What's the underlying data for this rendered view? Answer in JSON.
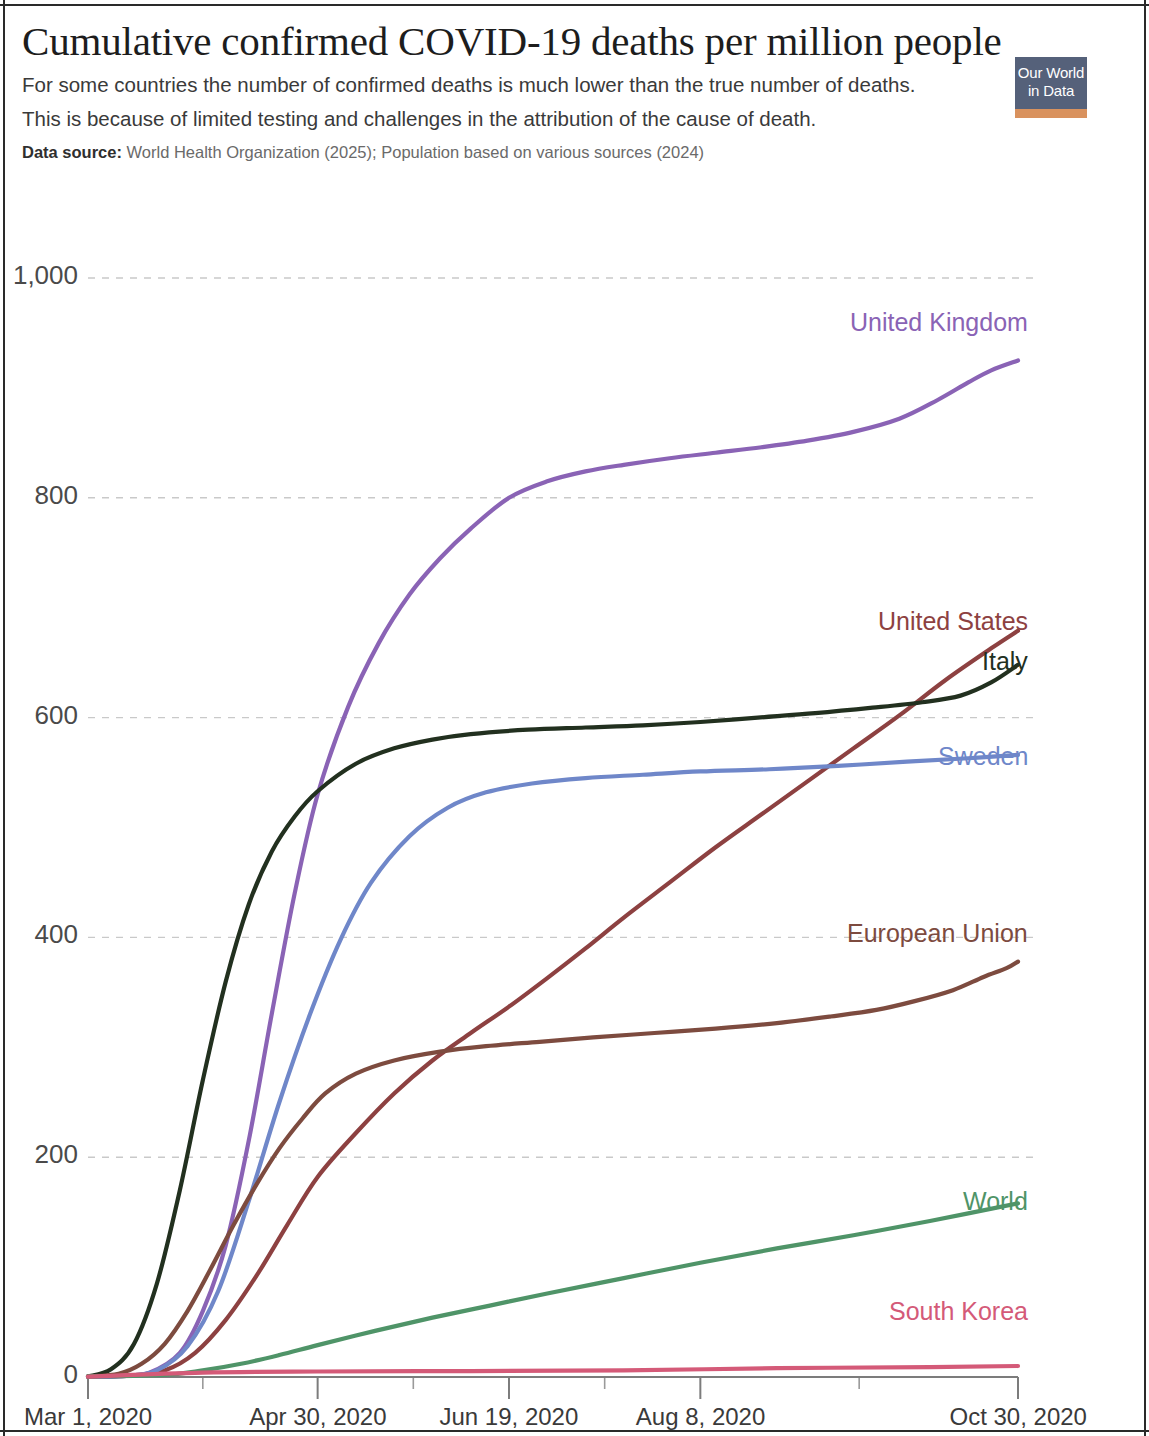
{
  "header": {
    "title": "Cumulative confirmed COVID-19 deaths per million people",
    "subtitle_line_1": "For some countries the number of confirmed deaths is much lower than the true number of deaths.",
    "subtitle_line_2": "This is because of limited testing and challenges in the attribution of the cause of death.",
    "source_label": "Data source:",
    "source_text": "World Health Organization (2025); Population based on various sources (2024)"
  },
  "logo": {
    "line1": "Our World",
    "line2": "in Data",
    "bg_color": "#55617a",
    "accent_color": "#d9925e"
  },
  "chart_data": {
    "type": "line",
    "title": "Cumulative confirmed COVID-19 deaths per million people",
    "xlabel": "",
    "ylabel": "",
    "grid": true,
    "legend_position": "right-inline-labels",
    "ylim": [
      0,
      1000
    ],
    "yticks": [
      0,
      200,
      400,
      600,
      800,
      1000
    ],
    "ytick_labels": [
      "0",
      "200",
      "400",
      "600",
      "800",
      "1,000"
    ],
    "xtick_labels": [
      "Mar 1, 2020",
      "Apr 30, 2020",
      "Jun 19, 2020",
      "Aug 8, 2020",
      "Oct 30, 2020"
    ],
    "xtick_positions_days": [
      0,
      60,
      110,
      160,
      243
    ],
    "xlim_days": [
      0,
      243
    ],
    "x_unit": "days since Mar 1, 2020",
    "series": [
      {
        "name": "United Kingdom",
        "color": "#8a63b5",
        "label_y_value": 958,
        "x": [
          0,
          8,
          16,
          24,
          30,
          36,
          42,
          48,
          54,
          60,
          68,
          76,
          84,
          92,
          100,
          110,
          120,
          130,
          140,
          152,
          164,
          176,
          188,
          200,
          212,
          222,
          230,
          236,
          243
        ],
        "values": [
          0.3,
          0.8,
          4,
          22,
          60,
          120,
          215,
          330,
          440,
          530,
          610,
          668,
          712,
          745,
          772,
          800,
          815,
          824,
          830,
          836,
          841,
          846,
          852,
          860,
          872,
          889,
          905,
          916,
          925
        ]
      },
      {
        "name": "United States",
        "color": "#8d4141",
        "label_y_value": 686,
        "x": [
          0,
          10,
          20,
          28,
          36,
          44,
          52,
          60,
          70,
          80,
          90,
          100,
          110,
          120,
          130,
          140,
          152,
          164,
          176,
          188,
          200,
          212,
          224,
          236,
          243
        ],
        "values": [
          0.2,
          1,
          6,
          22,
          52,
          92,
          138,
          182,
          222,
          258,
          288,
          313,
          337,
          363,
          390,
          418,
          450,
          482,
          512,
          542,
          572,
          602,
          634,
          663,
          679
        ]
      },
      {
        "name": "Italy",
        "color": "#22301f",
        "label_y_value": 650,
        "x": [
          0,
          6,
          12,
          18,
          24,
          30,
          36,
          42,
          48,
          54,
          60,
          70,
          80,
          90,
          100,
          115,
          130,
          145,
          160,
          175,
          190,
          205,
          218,
          228,
          236,
          243
        ],
        "values": [
          0.6,
          7,
          30,
          85,
          170,
          270,
          360,
          430,
          478,
          510,
          533,
          558,
          572,
          580,
          585,
          589,
          591,
          593,
          596,
          600,
          604,
          609,
          614,
          620,
          632,
          648
        ]
      },
      {
        "name": "Sweden",
        "color": "#6f87c9",
        "label_y_value": 563,
        "x": [
          0,
          10,
          18,
          26,
          34,
          42,
          50,
          58,
          66,
          74,
          84,
          94,
          104,
          116,
          130,
          145,
          160,
          178,
          196,
          214,
          230,
          243
        ],
        "values": [
          0.2,
          1,
          6,
          28,
          78,
          160,
          250,
          330,
          398,
          450,
          492,
          518,
          532,
          540,
          545,
          548,
          551,
          553,
          556,
          560,
          563,
          566
        ]
      },
      {
        "name": "European Union",
        "color": "#7d4b3f",
        "label_y_value": 402,
        "x": [
          0,
          8,
          14,
          20,
          26,
          32,
          38,
          44,
          50,
          56,
          62,
          70,
          80,
          92,
          104,
          118,
          132,
          148,
          164,
          180,
          194,
          206,
          216,
          226,
          234,
          240,
          243
        ],
        "values": [
          0.4,
          3,
          12,
          30,
          60,
          98,
          138,
          175,
          208,
          235,
          258,
          276,
          288,
          296,
          301,
          305,
          309,
          313,
          317,
          322,
          328,
          334,
          342,
          352,
          364,
          372,
          378
        ]
      },
      {
        "name": "World",
        "color": "#4f9468",
        "label_y_value": 158,
        "x": [
          0,
          20,
          30,
          40,
          50,
          60,
          75,
          90,
          105,
          120,
          140,
          160,
          180,
          200,
          220,
          243
        ],
        "values": [
          0.5,
          2,
          6,
          12,
          20,
          29,
          42,
          54,
          65,
          76,
          90,
          104,
          117,
          129,
          142,
          158
        ]
      },
      {
        "name": "South Korea",
        "color": "#d45a78",
        "label_y_value": 58,
        "x": [
          0,
          30,
          60,
          100,
          140,
          180,
          220,
          243
        ],
        "values": [
          0.3,
          4,
          5,
          5.4,
          6,
          8,
          9,
          10
        ]
      }
    ]
  }
}
